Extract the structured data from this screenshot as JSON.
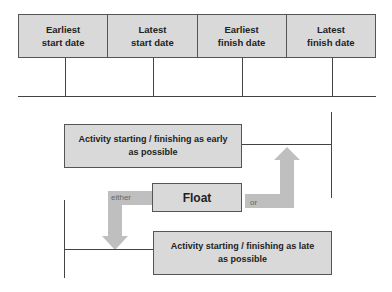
{
  "timeline": {
    "columns": [
      {
        "line1": "Earliest",
        "line2": "start date"
      },
      {
        "line1": "Latest",
        "line2": "start date"
      },
      {
        "line1": "Earliest",
        "line2": "finish date"
      },
      {
        "line1": "Latest",
        "line2": "finish date"
      }
    ]
  },
  "float_diagram": {
    "early_box": {
      "line1": "Activity starting / finishing as early",
      "line2": "as possible"
    },
    "float_label": "Float",
    "late_box": {
      "line1": "Activity starting / finishing as late",
      "line2": "as possible"
    },
    "either_label": "either",
    "or_label": "or"
  },
  "colors": {
    "box_fill": "#d9d9d9",
    "arrow_fill": "#bfbfbf",
    "line": "#444444"
  }
}
